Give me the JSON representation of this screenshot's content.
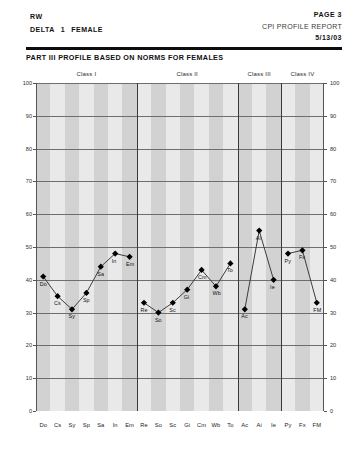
{
  "header": {
    "initials": "RW",
    "delta_label": "DELTA",
    "delta_value": "1",
    "gender": "FEMALE",
    "page": "PAGE 3",
    "report_title": "CPI PROFILE REPORT",
    "date": "5/13/03"
  },
  "section": {
    "title": "PART III PROFILE BASED ON NORMS FOR FEMALES"
  },
  "classes": [
    {
      "label": "Class I",
      "start": 0,
      "end": 7
    },
    {
      "label": "Class II",
      "start": 7,
      "end": 14
    },
    {
      "label": "Class III",
      "start": 14,
      "end": 17
    },
    {
      "label": "Class IV",
      "start": 17,
      "end": 20
    }
  ],
  "chart_data": {
    "type": "line",
    "title": "PART III PROFILE BASED ON NORMS FOR FEMALES",
    "xlabel": "",
    "ylabel": "",
    "ylim": [
      0,
      100
    ],
    "yticks": [
      0,
      10,
      20,
      30,
      40,
      50,
      60,
      70,
      80,
      90,
      100
    ],
    "grid": true,
    "legend": "none",
    "categories": [
      "Do",
      "Cs",
      "Sy",
      "Sp",
      "Sa",
      "In",
      "Em",
      "Re",
      "So",
      "Sc",
      "Gi",
      "Cm",
      "Wb",
      "To",
      "Ac",
      "Ai",
      "Ie",
      "Py",
      "Fx",
      "FM"
    ],
    "values": [
      41,
      35,
      31,
      36,
      44,
      48,
      47,
      33,
      30,
      33,
      37,
      43,
      38,
      45,
      31,
      55,
      40,
      48,
      49,
      33
    ],
    "segments": [
      [
        0,
        1,
        2,
        3,
        4,
        5,
        6
      ],
      [
        7,
        8,
        9,
        10,
        11,
        12,
        13
      ],
      [
        14,
        15,
        16
      ],
      [
        17,
        18,
        19
      ]
    ],
    "marker": "diamond",
    "marker_color": "#000000",
    "line_color": "#3d3d3d"
  }
}
